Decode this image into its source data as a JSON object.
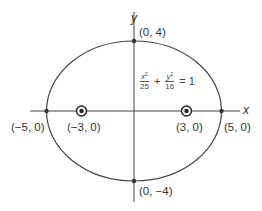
{
  "diagram": {
    "type": "ellipse",
    "axes": {
      "x_label": "x",
      "y_label": "y"
    },
    "equation": {
      "term1": {
        "numerator_var": "x",
        "numerator_exp": "2",
        "denominator": "25"
      },
      "plus": "+",
      "term2": {
        "numerator_var": "y",
        "numerator_exp": "2",
        "denominator": "16"
      },
      "equals": "=",
      "rhs": "1"
    },
    "points": {
      "top_vertex": "(0, 4)",
      "bottom_vertex": "(0, −4)",
      "left_vertex": "(−5, 0)",
      "right_vertex": "(5, 0)",
      "left_focus": "(−3, 0)",
      "right_focus": "(3, 0)"
    },
    "semi_major_axis": 5,
    "semi_minor_axis": 4,
    "focal_distance": 3,
    "colors": {
      "stroke": "#444444",
      "background": "#ffffff"
    }
  }
}
